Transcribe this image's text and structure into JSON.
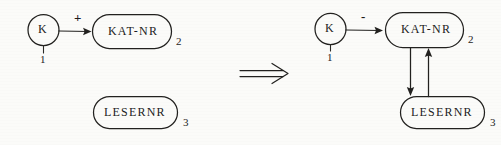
{
  "diagram": {
    "ink_color": "#22211f",
    "background_color": "#fbfbf9",
    "relation_symbol": "implication-double-arrow",
    "left_side": {
      "entity_circle": {
        "label": "K",
        "number": "1"
      },
      "sign": "+",
      "box_kat": {
        "label": "KAT-NR",
        "number": "2"
      },
      "box_leser": {
        "label": "LESERNR",
        "number": "3"
      }
    },
    "right_side": {
      "entity_circle": {
        "label": "K",
        "number": "1"
      },
      "sign": "-",
      "box_kat": {
        "label": "KAT-NR",
        "number": "2"
      },
      "box_leser": {
        "label": "LESERNR",
        "number": "3"
      }
    }
  }
}
